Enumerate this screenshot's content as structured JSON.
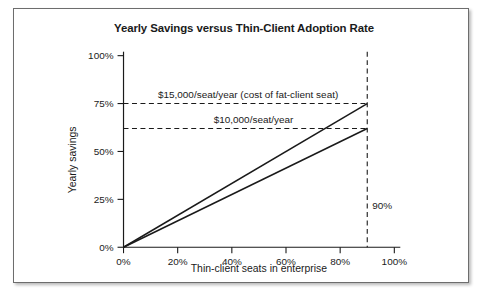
{
  "chart_data": {
    "type": "line",
    "title": "Yearly Savings versus Thin-Client Adoption Rate",
    "xlabel": "Thin-client seats in enterprise",
    "ylabel": "Yearly savings",
    "xlim": [
      0,
      100
    ],
    "ylim": [
      0,
      100
    ],
    "xticks": [
      "0%",
      "20%",
      "40%",
      "60%",
      "80%",
      "100%"
    ],
    "xtick_values": [
      0,
      20,
      40,
      60,
      80,
      100
    ],
    "yticks": [
      "0%",
      "25%",
      "50%",
      "75%",
      "100%"
    ],
    "ytick_values": [
      0,
      25,
      50,
      75,
      100
    ],
    "grid": false,
    "legend": "none",
    "series": [
      {
        "name": "$15,000/seat/year (cost of fat-client seat)",
        "x": [
          0,
          90
        ],
        "values": [
          0,
          75
        ]
      },
      {
        "name": "$10,000/seat/year",
        "x": [
          0,
          90
        ],
        "values": [
          0,
          62
        ]
      }
    ],
    "reference_lines": [
      {
        "name": "cost-of-fat-client-seat",
        "orientation": "horizontal",
        "value": 75,
        "label": "$15,000/seat/year (cost of fat-client seat)",
        "label_x": 46
      },
      {
        "name": "ten-thousand-per-seat",
        "orientation": "horizontal",
        "value": 62,
        "label": "$10,000/seat/year",
        "label_x": 48
      },
      {
        "name": "adoption-rate-marker",
        "orientation": "vertical",
        "value": 90,
        "label": "90%",
        "label_y": 22
      }
    ]
  }
}
